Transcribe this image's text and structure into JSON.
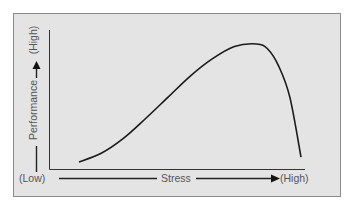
{
  "chart_data": {
    "type": "line",
    "title": "",
    "xlabel": "Stress",
    "ylabel": "Performance",
    "x_low_label": "(Low)",
    "x_high_label": "(High)",
    "y_high_label": "(High)",
    "grid": false,
    "legend": null,
    "series": [
      {
        "name": "Performance",
        "x": [
          0,
          10,
          20,
          30,
          40,
          50,
          60,
          70,
          80,
          85,
          90,
          95,
          100
        ],
        "values": [
          3,
          10,
          22,
          38,
          55,
          72,
          86,
          96,
          98,
          94,
          80,
          55,
          7
        ]
      }
    ],
    "xlim": [
      0,
      100
    ],
    "ylim": [
      0,
      100
    ]
  },
  "colors": {
    "panel_bg": "#e4e4e4",
    "panel_border": "#8a8a8a",
    "curve": "#1a1a1a",
    "axis": "#333333",
    "text": "#555555"
  }
}
